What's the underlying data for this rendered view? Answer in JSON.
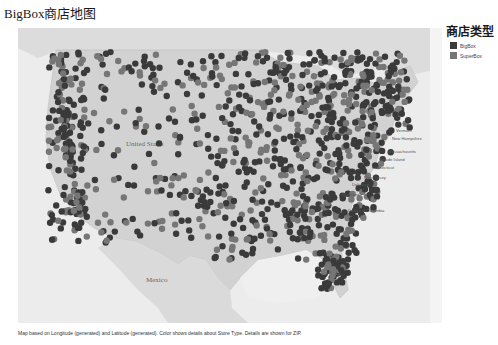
{
  "title": "BigBox商店地图",
  "legend": {
    "title": "商店类型",
    "items": [
      {
        "label": "BigBox",
        "color": "#3a3a3a"
      },
      {
        "label": "SuperBox",
        "color": "#767676"
      }
    ]
  },
  "map": {
    "background": "#e4e4e4",
    "land_us": "#d6d6d6",
    "water": "#f2f2f2",
    "labels": {
      "country_us": "United States",
      "country_mx": "Mexico",
      "states": [
        "Vermont",
        "New Hampshire",
        "Massachusetts",
        "Rhode Island",
        "Connecticut",
        "New Jersey",
        "Delaware",
        "Maryland",
        "District of Columbia"
      ]
    }
  },
  "caption": "Map based on Longitude (generated) and Latitude (generated).  Color shows details about Store Type.  Details are shown for ZIP."
}
